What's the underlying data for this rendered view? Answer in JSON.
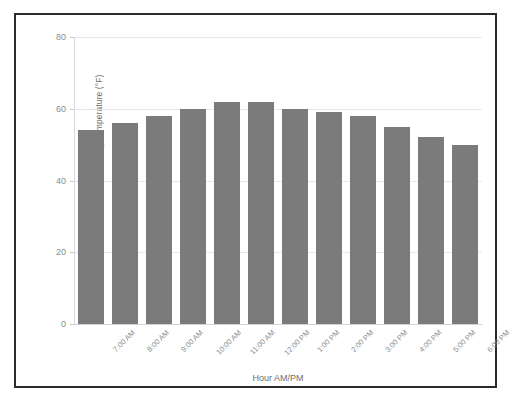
{
  "chart_data": {
    "type": "bar",
    "title": "",
    "xlabel": "Hour AM/PM",
    "ylabel": "Avg Temperature (°F)",
    "categories": [
      "7:00 AM",
      "8:00 AM",
      "9:00 AM",
      "10:00 AM",
      "11:00 AM",
      "12:00 PM",
      "1:00 PM",
      "2:00 PM",
      "3:00 PM",
      "4:00 PM",
      "5:00 PM",
      "6:00 PM"
    ],
    "values": [
      54,
      56,
      58,
      60,
      62,
      62,
      60,
      59,
      58,
      55,
      52,
      50
    ],
    "ylim": [
      0,
      80
    ],
    "yticks": [
      0,
      20,
      40,
      60,
      80
    ],
    "ytick_labels": [
      "0",
      "20",
      "40",
      "60",
      "80"
    ],
    "grid": true,
    "legend": false,
    "bar_color": "#7b7b7b",
    "grid_color": "#e6e6e6",
    "axis_text_color": "#8c8c8c",
    "border_color": "#2b2b2b"
  }
}
